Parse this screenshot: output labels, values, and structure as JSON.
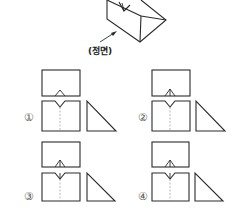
{
  "figure": {
    "front_label": "(정면)",
    "options": [
      {
        "number": "①",
        "top_notch": "simple"
      },
      {
        "number": "②",
        "top_notch": "with-center-line"
      },
      {
        "number": "③",
        "top_notch": "with-center-line",
        "front_notch": "with-center-line"
      },
      {
        "number": "④",
        "top_notch": "with-center-line",
        "front_notch": "with-center-line"
      }
    ]
  },
  "colors": {
    "line": "#2a2a2a",
    "hidden_line": "#8a8a8a",
    "background": "#ffffff"
  }
}
